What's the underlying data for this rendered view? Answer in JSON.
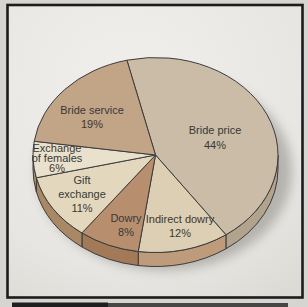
{
  "figure": {
    "kind": "scanned-book-figure",
    "frame_color": "#1c1c1c"
  },
  "chart_data": {
    "type": "pie",
    "style": "3d",
    "start_angle_deg": 103.5,
    "direction": "clockwise",
    "label_color": "#383838",
    "outline_color": "#3c3c3c",
    "shadow_color": "#82807a",
    "geometry": {
      "cx": 155.5,
      "cy": 155,
      "rx": 122.5,
      "ry": 97.5,
      "depth": 14
    },
    "slices": [
      {
        "label": "Bride price",
        "value": 44,
        "color": "#cabca6",
        "rim_color": "#b2a48c",
        "label_lines": [
          "Bride price",
          "44%"
        ],
        "label_x": 215,
        "label_y": 134,
        "line_height": 15
      },
      {
        "label": "Indirect dowry",
        "value": 12,
        "color": "#dccfb4",
        "rim_color": "#bd9b7b",
        "label_lines": [
          "Indirect dowry",
          "12%"
        ],
        "label_x": 180,
        "label_y": 223,
        "line_height": 14
      },
      {
        "label": "Dowry",
        "value": 8,
        "color": "#b88f6e",
        "rim_color": "#a37a58",
        "label_lines": [
          "Dowry",
          "8%"
        ],
        "label_x": 126,
        "label_y": 222,
        "line_height": 14
      },
      {
        "label": "Gift exchange",
        "value": 11,
        "color": "#e3d8bd",
        "rim_color": "#a98965",
        "label_lines": [
          "Gift",
          "exchange",
          "11%"
        ],
        "label_x": 82,
        "label_y": 184,
        "line_height": 14
      },
      {
        "label": "Exchange of females",
        "value": 6,
        "color": "#eae1cd",
        "rim_color": "#b29070",
        "label_lines": [
          "Exchange",
          "of females",
          "6%"
        ],
        "label_x": 57,
        "label_y": 152,
        "line_height": 10
      },
      {
        "label": "Bride service",
        "value": 19,
        "color": "#c2a487",
        "rim_color": "#ab8c6e",
        "label_lines": [
          "Bride service",
          "19%"
        ],
        "label_x": 92,
        "label_y": 114,
        "line_height": 14
      }
    ]
  }
}
